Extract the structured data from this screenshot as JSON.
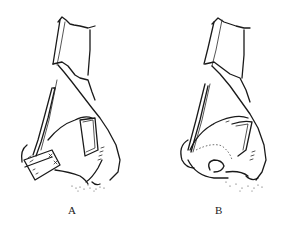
{
  "figure": {
    "panels": [
      {
        "id": "A",
        "label": "A",
        "description": "Nasal profile with rectangular graft/flap folded at columella-tip region"
      },
      {
        "id": "B",
        "label": "B",
        "description": "Nasal profile with flap rotated and folded into nasal tip"
      }
    ]
  }
}
